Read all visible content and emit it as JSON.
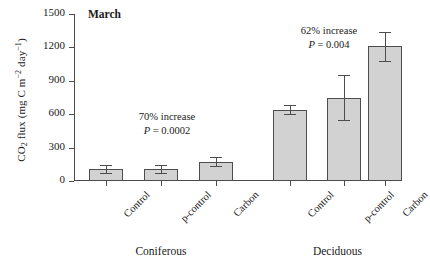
{
  "chart_data": {
    "type": "bar",
    "title": "March",
    "xlabel": "",
    "ylabel": "CO2 flux (mg C m-2 day-1)",
    "ylabel_parts": {
      "prefix": "CO",
      "sub1": "2",
      "mid": " flux (mg C m",
      "sup1": "−2",
      "mid2": " day",
      "sup2": "−1",
      "suffix": ")"
    },
    "ylim": [
      0,
      1500
    ],
    "yticks": [
      0,
      300,
      600,
      900,
      1200,
      1500
    ],
    "ytick_labels": [
      "0",
      "300",
      "600",
      "900",
      "1200",
      "1500"
    ],
    "grid": false,
    "legend": "none",
    "groups": [
      {
        "name": "Coniferous",
        "categories": [
          "Control",
          "p-control",
          "Carbon"
        ],
        "values": [
          110,
          105,
          175
        ],
        "errors": [
          35,
          35,
          40
        ]
      },
      {
        "name": "Deciduous",
        "categories": [
          "Control",
          "p-control",
          "Carbon"
        ],
        "values": [
          640,
          750,
          1210
        ],
        "errors": [
          40,
          200,
          130
        ]
      }
    ],
    "annotations": [
      {
        "id": "coniferous-annotation",
        "percent_text": "70% increase",
        "p_label": "P",
        "p_equals": " = ",
        "p_value": "0.0002"
      },
      {
        "id": "deciduous-annotation",
        "percent_text": "62% increase",
        "p_label": "P",
        "p_equals": " = ",
        "p_value": "0.004"
      }
    ],
    "colors": {
      "bar_fill": "#d2d2d2",
      "bar_edge": "#4d4d4d",
      "axis": "#4a4a4a",
      "text": "#1a1a1a",
      "background": "#ffffff"
    }
  }
}
